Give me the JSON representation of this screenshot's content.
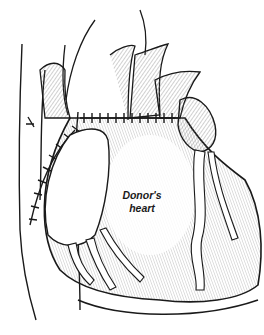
{
  "figure": {
    "label_line1": "Donor's",
    "label_line2": "heart",
    "colors": {
      "ink": "#1a1a1a",
      "background": "#ffffff",
      "shade": "#9a9a9a"
    }
  }
}
